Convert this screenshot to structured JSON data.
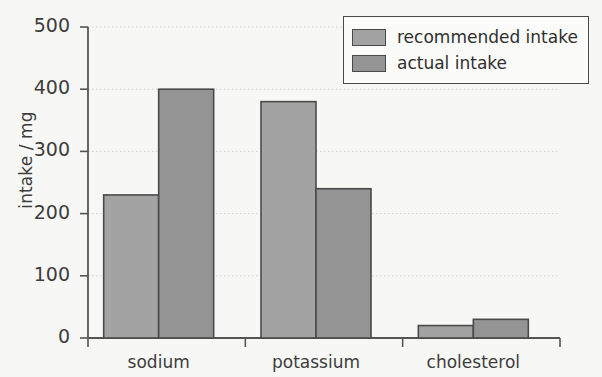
{
  "chart_data": {
    "type": "bar",
    "title": "",
    "xlabel": "",
    "ylabel": "intake / mg",
    "categories": [
      "sodium",
      "potassium",
      "cholesterol"
    ],
    "series": [
      {
        "name": "recommended intake",
        "values": [
          230,
          380,
          20
        ],
        "color": "#a3a3a3"
      },
      {
        "name": "actual intake",
        "values": [
          400,
          240,
          30
        ],
        "color": "#949494"
      }
    ],
    "ylim": [
      0,
      500
    ],
    "yticks": [
      0,
      100,
      200,
      300,
      400,
      500
    ],
    "ytick_labels": [
      "0",
      "100",
      "200",
      "300",
      "400",
      "500"
    ],
    "grid": true,
    "grid_axis": "y",
    "grid_style": "dotted",
    "legend_position": "top-right",
    "bar_edge_color": "#4a4a4a",
    "axis_color": "#555555",
    "grid_color": "#cfcfcf",
    "background_color": "#f7f7f5",
    "text_color": "#3d3d3d"
  }
}
